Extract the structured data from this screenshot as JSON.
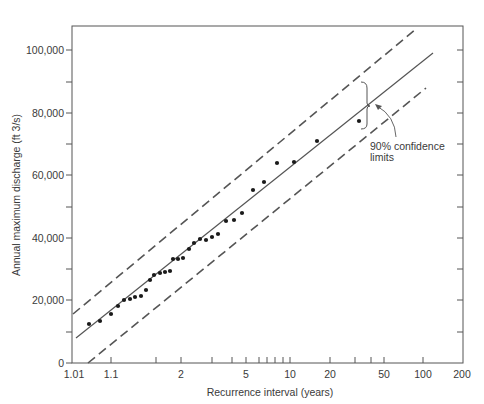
{
  "chart_data": {
    "type": "scatter",
    "title": "",
    "xlabel": "Recurrence interval (years)",
    "ylabel": "Annual maximum discharge (ft 3/s)",
    "x_scale": "gumbel-probability",
    "xlim": [
      1.01,
      200
    ],
    "ylim": [
      0,
      108000
    ],
    "grid": false,
    "legend": null,
    "x_ticks": [
      {
        "value": 1.01,
        "label": "1.01",
        "px": 74
      },
      {
        "value": 1.1,
        "label": "1.1",
        "px": 111
      },
      {
        "value": 1.5,
        "label": "",
        "px": 156
      },
      {
        "value": 2,
        "label": "2",
        "px": 181
      },
      {
        "value": 3,
        "label": "",
        "px": 212
      },
      {
        "value": 4,
        "label": "",
        "px": 232
      },
      {
        "value": 5,
        "label": "5",
        "px": 246
      },
      {
        "value": 6,
        "label": "",
        "px": 259
      },
      {
        "value": 7,
        "label": "",
        "px": 267
      },
      {
        "value": 8,
        "label": "",
        "px": 275
      },
      {
        "value": 9,
        "label": "",
        "px": 283
      },
      {
        "value": 10,
        "label": "10",
        "px": 290
      },
      {
        "value": 20,
        "label": "20",
        "px": 330
      },
      {
        "value": 30,
        "label": "",
        "px": 355
      },
      {
        "value": 40,
        "label": "",
        "px": 371
      },
      {
        "value": 50,
        "label": "50",
        "px": 384
      },
      {
        "value": 100,
        "label": "100",
        "px": 423
      },
      {
        "value": 200,
        "label": "200",
        "px": 462
      }
    ],
    "y_ticks": [
      {
        "value": 0,
        "label": "0"
      },
      {
        "value": 10000,
        "label": ""
      },
      {
        "value": 20000,
        "label": "20,000"
      },
      {
        "value": 30000,
        "label": ""
      },
      {
        "value": 40000,
        "label": "40,000"
      },
      {
        "value": 50000,
        "label": ""
      },
      {
        "value": 60000,
        "label": "60,000"
      },
      {
        "value": 70000,
        "label": ""
      },
      {
        "value": 80000,
        "label": "80,000"
      },
      {
        "value": 90000,
        "label": ""
      },
      {
        "value": 100000,
        "label": "100,000"
      }
    ],
    "series": [
      {
        "name": "Observed annual maxima",
        "style": "points",
        "points": [
          {
            "T": 1.04,
            "Q": 12500,
            "px": [
              89,
              324
            ]
          },
          {
            "T": 1.07,
            "Q": 13400,
            "px": [
              100,
              321
            ]
          },
          {
            "T": 1.1,
            "Q": 15700,
            "px": [
              111,
              314
            ]
          },
          {
            "T": 1.13,
            "Q": 18200,
            "px": [
              118,
              306
            ]
          },
          {
            "T": 1.17,
            "Q": 20200,
            "px": [
              124,
              300
            ]
          },
          {
            "T": 1.2,
            "Q": 20500,
            "px": [
              130,
              299
            ]
          },
          {
            "T": 1.25,
            "Q": 21100,
            "px": [
              135,
              297
            ]
          },
          {
            "T": 1.3,
            "Q": 21400,
            "px": [
              141,
              296
            ]
          },
          {
            "T": 1.35,
            "Q": 23400,
            "px": [
              146,
              290
            ]
          },
          {
            "T": 1.4,
            "Q": 26600,
            "px": [
              150,
              280
            ]
          },
          {
            "T": 1.45,
            "Q": 28200,
            "px": [
              154,
              275
            ]
          },
          {
            "T": 1.55,
            "Q": 28800,
            "px": [
              160,
              273
            ]
          },
          {
            "T": 1.6,
            "Q": 29100,
            "px": [
              165,
              272
            ]
          },
          {
            "T": 1.7,
            "Q": 29400,
            "px": [
              170,
              271
            ]
          },
          {
            "T": 1.75,
            "Q": 33300,
            "px": [
              173,
              259
            ]
          },
          {
            "T": 1.85,
            "Q": 33300,
            "px": [
              178,
              259
            ]
          },
          {
            "T": 2.0,
            "Q": 33600,
            "px": [
              183,
              258
            ]
          },
          {
            "T": 2.15,
            "Q": 36500,
            "px": [
              189,
              249
            ]
          },
          {
            "T": 2.3,
            "Q": 38400,
            "px": [
              194,
              243
            ]
          },
          {
            "T": 2.5,
            "Q": 39700,
            "px": [
              200,
              239
            ]
          },
          {
            "T": 2.75,
            "Q": 39400,
            "px": [
              206,
              240
            ]
          },
          {
            "T": 3.0,
            "Q": 40300,
            "px": [
              212,
              237
            ]
          },
          {
            "T": 3.3,
            "Q": 41300,
            "px": [
              218,
              234
            ]
          },
          {
            "T": 3.7,
            "Q": 45400,
            "px": [
              226,
              221
            ]
          },
          {
            "T": 4.2,
            "Q": 45800,
            "px": [
              234,
              220
            ]
          },
          {
            "T": 4.8,
            "Q": 48000,
            "px": [
              242,
              213
            ]
          },
          {
            "T": 5.5,
            "Q": 55400,
            "px": [
              253,
              190
            ]
          },
          {
            "T": 6.5,
            "Q": 57900,
            "px": [
              264,
              182
            ]
          },
          {
            "T": 8.5,
            "Q": 64000,
            "px": [
              277,
              163
            ]
          },
          {
            "T": 11,
            "Q": 64300,
            "px": [
              294,
              162
            ]
          },
          {
            "T": 16.5,
            "Q": 71000,
            "px": [
              317,
              141
            ]
          },
          {
            "T": 35,
            "Q": 77400,
            "px": [
              359,
              121
            ]
          }
        ]
      },
      {
        "name": "Fitted frequency line",
        "style": "solid",
        "from": {
          "T": 1.01,
          "Q": 8000,
          "px": [
            76,
            338
          ]
        },
        "to": {
          "T": 115,
          "Q": 99800,
          "px": [
            433,
            53
          ]
        }
      },
      {
        "name": "Upper 90% confidence limit",
        "style": "dashed",
        "from": {
          "T": 1.01,
          "Q": 15700,
          "px": [
            73,
            314
          ]
        },
        "to": {
          "T": 55,
          "Q": 106900,
          "px": [
            416,
            29
          ]
        }
      },
      {
        "name": "Lower 90% confidence limit",
        "style": "dashed",
        "from": {
          "T": 1.05,
          "Q": 0,
          "px": [
            88,
            363
          ]
        },
        "to": {
          "T": 110,
          "Q": 88000,
          "px": [
            426,
            88
          ]
        }
      }
    ],
    "annotations": [
      {
        "text": "90% confidence limits",
        "target": "confidence bracket at T≈40 years"
      }
    ]
  },
  "labels": {
    "y_axis_title": "Annual maximum discharge (ft 3/s)",
    "x_axis_title": "Recurrence interval (years)",
    "annotation_line1": "90% confidence",
    "annotation_line2": "limits",
    "y_ticks": [
      "0",
      "20,000",
      "40,000",
      "60,000",
      "80,000",
      "100,000"
    ],
    "x_ticks": [
      "1.01",
      "1.1",
      "2",
      "5",
      "10",
      "20",
      "50",
      "100",
      "200"
    ]
  },
  "colors": {
    "ink": "#3a3a3a",
    "line": "#555555",
    "dashed": "#555555",
    "points": "#1a1a1a",
    "background": "#ffffff"
  }
}
